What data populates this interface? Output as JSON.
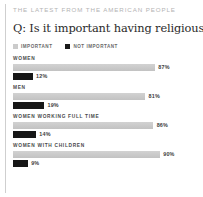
{
  "kicker": "THE LATEST FROM THE AMERICAN PEOPLE",
  "question": "Q: Is it important having religious faith?",
  "legend": {
    "important": {
      "label": "IMPORTANT",
      "color": "#cbcbcb"
    },
    "not_important": {
      "label": "NOT IMPORTANT",
      "color": "#1a1a1a"
    }
  },
  "chart_data": {
    "type": "bar",
    "title": "Q: Is it important having religious faith?",
    "subtitle": "THE LATEST FROM THE AMERICAN PEOPLE",
    "orientation": "horizontal",
    "categories": [
      "WOMEN",
      "MEN",
      "WOMEN WORKING FULL TIME",
      "WOMEN WITH CHILDREN"
    ],
    "series": [
      {
        "name": "IMPORTANT",
        "color": "#cbcbcb",
        "values": [
          87,
          81,
          86,
          90
        ]
      },
      {
        "name": "NOT IMPORTANT",
        "color": "#1a1a1a",
        "values": [
          12,
          19,
          14,
          9
        ]
      }
    ],
    "value_labels": [
      [
        "87%",
        "12%"
      ],
      [
        "81%",
        "19%"
      ],
      [
        "86%",
        "14%"
      ],
      [
        "90%",
        "9%"
      ]
    ],
    "xlabel": "",
    "ylabel": "",
    "xlim": [
      0,
      100
    ],
    "grid": false,
    "legend_position": "top"
  },
  "groups": [
    {
      "label": "WOMEN",
      "important": {
        "value": 87,
        "text": "87%"
      },
      "not_important": {
        "value": 12,
        "text": "12%"
      }
    },
    {
      "label": "MEN",
      "important": {
        "value": 81,
        "text": "81%"
      },
      "not_important": {
        "value": 19,
        "text": "19%"
      }
    },
    {
      "label": "WOMEN WORKING FULL TIME",
      "important": {
        "value": 86,
        "text": "86%"
      },
      "not_important": {
        "value": 14,
        "text": "14%"
      }
    },
    {
      "label": "WOMEN WITH CHILDREN",
      "important": {
        "value": 90,
        "text": "90%"
      },
      "not_important": {
        "value": 9,
        "text": "9%"
      }
    }
  ]
}
